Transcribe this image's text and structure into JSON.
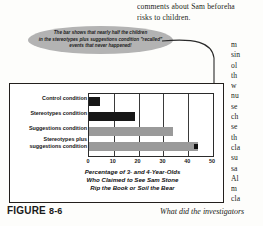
{
  "body_text": {
    "top_column": [
      "comments about Sam beforeha",
      "risks to children."
    ],
    "right_column": [
      "m",
      "sin",
      "ol",
      "th",
      "w",
      "nu",
      "se",
      "ch",
      "se",
      "th",
      "cla",
      "su",
      "sa",
      "Al",
      "m",
      "cla"
    ]
  },
  "callout": {
    "lines": [
      "The bar shows that nearly half the children",
      "in the stereotypes plus suggestions condition \"recalled\"",
      "events that never happened!"
    ],
    "fill_color": "#b3b3b3"
  },
  "caption": {
    "figure_label": "FIGURE",
    "figure_number": "8-6",
    "right_text": "What did the investigators"
  },
  "chart_data": {
    "type": "bar",
    "orientation": "horizontal",
    "title": "",
    "categories": [
      "Control condition",
      "Stereotypes condition",
      "Suggestions condition",
      "Stereotypes plus\nsuggestions condition"
    ],
    "category_labels": [
      [
        "Control condition"
      ],
      [
        "Stereotypes condition"
      ],
      [
        "Suggestions condition"
      ],
      [
        "Stereotypes plus",
        "suggestions condition"
      ]
    ],
    "values": [
      4.5,
      18.5,
      34,
      44
    ],
    "bar_colors": [
      "#171717",
      "#171717",
      "#9a9a9a",
      "#9a9a9a"
    ],
    "xlabel_lines": [
      "Percentage of 3- and 4-Year-Olds",
      "Who Claimed to See Sam Stone",
      "Rip the Book or Soil the Bear"
    ],
    "ylabel": "",
    "xlim": [
      0,
      50
    ],
    "xticks": [
      0,
      10,
      20,
      30,
      40,
      50
    ],
    "grid": true,
    "legend": "none",
    "annotation_marker_value": 43
  }
}
